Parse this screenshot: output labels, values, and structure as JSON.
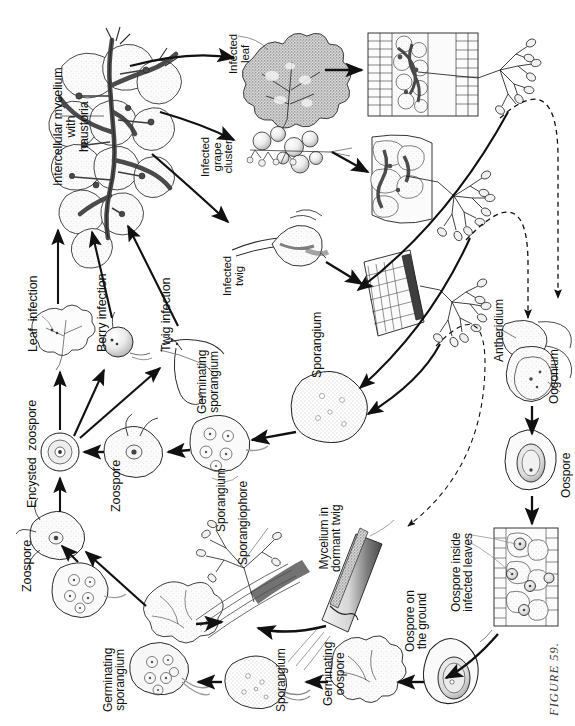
{
  "figure": {
    "caption": "FIGURE 59.",
    "orientation": "rotated-90",
    "background": "#ffffff",
    "ink": "#111111"
  },
  "labels": {
    "intercellular_mycelium": "Intercellular mycelium\nwith\nhaustoria",
    "infected_leaf": "Infected\nleaf",
    "infected_grape_cluster": "Infected\ngrape\ncluster",
    "infected_twig": "Infected\ntwig",
    "leaf_infection": "Leaf  infection",
    "berry_infection": "Berry infection",
    "twig_infection": "Twig infection",
    "encysted_zoospore": "Encysted  zoospore",
    "zoospore_upper": "Zoospore",
    "germinating_sporangium_upper": "Germinating\nsporangium",
    "sporangium_main": "Sporangium",
    "antheridium": "Antheridium",
    "oogonium": "Oogonium",
    "oospore": "Oospore",
    "oospore_inside_infected_leaves": "Oospore inside\ninfected leaves",
    "oospore_on_the_ground": "Oospore on\nthe ground",
    "germinating_oospore": "Germinating\noospore",
    "sporangium_lower_cycle": "Sporangium",
    "zoospore_lower": "Zoospore",
    "germinating_sporangium_lower": "Germinating\nsporangium",
    "sporangium_on_sporangiophore": "Sporangium",
    "sporangiophore": "Sporangiophore",
    "mycelium_in_dormant_twig": "Mycelium in\ndormant twig"
  },
  "nodes": [
    {
      "id": "intercellular-mycelium",
      "name": "Intercellular mycelium with haustoria"
    },
    {
      "id": "infected-leaf",
      "name": "Infected leaf"
    },
    {
      "id": "leaf-section-sporulating",
      "name": "Leaf cross-section with sporangiophores"
    },
    {
      "id": "infected-grape-cluster",
      "name": "Infected grape cluster"
    },
    {
      "id": "berry-section-sporulating",
      "name": "Berry cross-section with sporangiophores"
    },
    {
      "id": "infected-twig",
      "name": "Infected twig"
    },
    {
      "id": "twig-section-sporulating",
      "name": "Twig cross-section with sporangiophores"
    },
    {
      "id": "antheridium-oogonium",
      "name": "Antheridium and oogonium"
    },
    {
      "id": "oospore",
      "name": "Oospore"
    },
    {
      "id": "oospore-inside-leaves",
      "name": "Oospore inside infected leaves"
    },
    {
      "id": "oospore-on-ground",
      "name": "Oospore on the ground"
    },
    {
      "id": "germinating-oospore",
      "name": "Germinating oospore"
    },
    {
      "id": "sporangium-from-oospore",
      "name": "Sporangium from germinating oospore"
    },
    {
      "id": "germinated-sporangium-vesicle",
      "name": "Germinated sporangium releasing zoospores"
    },
    {
      "id": "germinating-sporangium-lower",
      "name": "Germinating sporangium"
    },
    {
      "id": "zoospore-lower",
      "name": "Zoospore"
    },
    {
      "id": "mycelium-dormant-twig",
      "name": "Mycelium in dormant twig"
    },
    {
      "id": "sporangiophore-on-twig",
      "name": "Sporangiophore bearing sporangia"
    },
    {
      "id": "germinating-sporangium-upper",
      "name": "Germinating sporangium"
    },
    {
      "id": "zoospore-upper",
      "name": "Zoospore"
    },
    {
      "id": "encysted-zoospore",
      "name": "Encysted zoospore"
    },
    {
      "id": "sporangium-main",
      "name": "Sporangium"
    },
    {
      "id": "leaf-infection",
      "name": "Leaf infection"
    },
    {
      "id": "berry-infection",
      "name": "Berry infection"
    },
    {
      "id": "twig-infection",
      "name": "Twig infection"
    }
  ]
}
